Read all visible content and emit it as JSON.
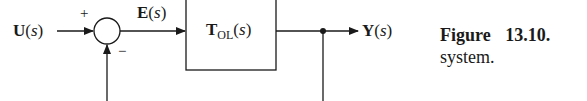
{
  "diagram": {
    "input": {
      "name": "U",
      "arg": "s"
    },
    "error": {
      "name": "E",
      "arg": "s"
    },
    "block": {
      "name": "T",
      "subscript": "OL",
      "arg": "s"
    },
    "output": {
      "name": "Y",
      "arg": "s"
    },
    "summing_junction": {
      "plus_sign": "+",
      "minus_sign": "−"
    },
    "feedback": "unity negative feedback from output to summing junction"
  },
  "caption": {
    "label": "Figure 13.10.",
    "line2": "system."
  },
  "colors": {
    "line": "#1a1a1a",
    "background": "#ffffff"
  }
}
